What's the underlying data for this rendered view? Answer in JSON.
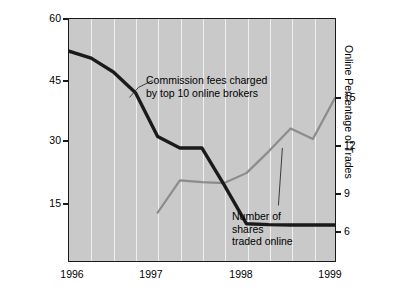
{
  "chart_data": {
    "type": "line",
    "title": "",
    "xlabel": "",
    "ylabel": "For Commission Fees ($)",
    "y2label": "Online Percentage of Trades",
    "grid": true,
    "legend": "none (inline annotations)",
    "xlim": [
      1996,
      1999
    ],
    "ylim": [
      7.5,
      60
    ],
    "y2lim": [
      4.5,
      18
    ],
    "xticks": [
      "1996",
      "1997",
      "1998",
      "1999"
    ],
    "xtick_values": [
      1996,
      1997,
      1998,
      1999
    ],
    "yticks": [
      "15",
      "30",
      "45",
      "60"
    ],
    "ytick_values": [
      15,
      30,
      45,
      60
    ],
    "y2ticks": [
      "6",
      "9",
      "12",
      "15"
    ],
    "y2tick_values": [
      6,
      9,
      12,
      15
    ],
    "series": [
      {
        "name": "Commission fees charged by top 10 online brokers",
        "axis": "left",
        "units": "$",
        "color": "#1a1a1a",
        "x": [
          1996.0,
          1996.25,
          1996.5,
          1996.75,
          1997.0,
          1997.25,
          1997.5,
          1997.75,
          1998.0,
          1998.25,
          1998.5,
          1998.75,
          1999.0
        ],
        "values": [
          53.0,
          51.5,
          48.5,
          44.0,
          34.5,
          32.0,
          32.0,
          24.0,
          15.6,
          15.4,
          15.3,
          15.3,
          15.3
        ]
      },
      {
        "name": "Number of shares traded online",
        "axis": "right",
        "units": "percent",
        "color": "#8c8c8c",
        "x": [
          1997.0,
          1997.25,
          1997.5,
          1997.75,
          1998.0,
          1998.25,
          1998.5,
          1998.75,
          1999.0
        ],
        "values": [
          7.2,
          9.0,
          8.9,
          8.85,
          9.4,
          10.6,
          11.9,
          11.3,
          13.6
        ]
      }
    ],
    "annotations": [
      {
        "id": "commission-fees-annotation",
        "text": "Commission fees charged\nby top 10 online brokers",
        "points_to_series": "Commission fees charged by top 10 online brokers"
      },
      {
        "id": "shares-traded-annotation",
        "text": "Number of\nshares\ntraded online",
        "points_to_series": "Number of shares traded online"
      }
    ],
    "colors": {
      "plot_background": "#c9c9c9",
      "gridline": "#efefef",
      "frame": "#1a1a1a",
      "fees_line": "#1a1a1a",
      "online_line": "#8c8c8c",
      "page_background": "#ffffff",
      "text": "#000000"
    }
  }
}
